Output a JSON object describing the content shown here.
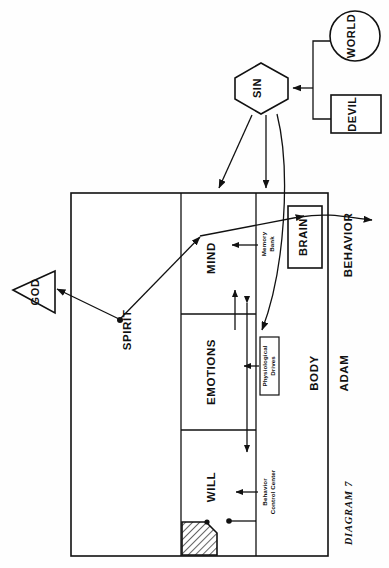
{
  "figure": {
    "caption": "DIAGRAM 7",
    "person_label": "ADAM",
    "output_label": "BEHAVIOR"
  },
  "external_nodes": [
    {
      "id": "world",
      "label": "WORLD",
      "shape": "circle"
    },
    {
      "id": "devil",
      "label": "DEVIL",
      "shape": "rectangle"
    },
    {
      "id": "sin",
      "label": "SIN",
      "shape": "hexagon"
    },
    {
      "id": "god",
      "label": "GOD",
      "shape": "triangle"
    }
  ],
  "person_regions": [
    {
      "id": "spirit",
      "label": "SPIRIT"
    },
    {
      "id": "mind",
      "label": "MIND"
    },
    {
      "id": "emotions",
      "label": "EMOTIONS"
    },
    {
      "id": "will",
      "label": "WILL"
    },
    {
      "id": "body",
      "label": "BODY"
    }
  ],
  "body_components": [
    {
      "id": "brain",
      "label": "BRAIN"
    },
    {
      "id": "memory-bank",
      "label_line1": "Memory",
      "label_line2": "Bank"
    },
    {
      "id": "physiological-drives",
      "label_line1": "Physiological",
      "label_line2": "Drives"
    },
    {
      "id": "behavior-control-center",
      "label_line1": "Behavior",
      "label_line2": "Control Center"
    }
  ],
  "colors": {
    "ink": "#111111",
    "paper": "#fefefe"
  }
}
